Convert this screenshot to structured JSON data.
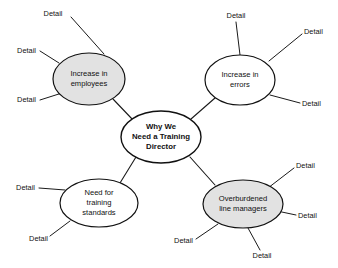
{
  "diagram": {
    "type": "mind-map",
    "background_color": "#ffffff",
    "stroke_color": "#111111",
    "shaded_fill": "#e2e2e2",
    "plain_fill": "#ffffff",
    "center": {
      "id": "center",
      "lines": [
        "Why We",
        "Need a Training",
        "Director"
      ],
      "line1": "Why We",
      "line2": "Need a Training",
      "line3": "Director",
      "fill": "#ffffff",
      "bold": true,
      "cx": 161,
      "cy": 137,
      "rx": 40,
      "ry": 26
    },
    "branches": [
      {
        "id": "increase-in-employees",
        "line1": "Increase in",
        "line2": "employees",
        "fill": "#e2e2e2",
        "cx": 89,
        "cy": 79,
        "rx": 36,
        "ry": 26,
        "details": [
          {
            "label": "Detail",
            "x": 53,
            "y": 14,
            "anchor": "middle",
            "lx1": 71,
            "ly1": 17,
            "lx2": 104,
            "ly2": 54
          },
          {
            "label": "Detail",
            "x": 36,
            "y": 51,
            "anchor": "end",
            "lx1": 40,
            "ly1": 51,
            "lx2": 59,
            "ly2": 63
          },
          {
            "label": "Detail",
            "x": 36,
            "y": 100,
            "anchor": "end",
            "lx1": 40,
            "ly1": 100,
            "lx2": 62,
            "ly2": 93
          }
        ]
      },
      {
        "id": "increase-in-errors",
        "line1": "Increase in",
        "line2": "errors",
        "fill": "#ffffff",
        "cx": 240,
        "cy": 80,
        "rx": 35,
        "ry": 25,
        "details": [
          {
            "label": "Detail",
            "x": 236,
            "y": 16,
            "anchor": "middle",
            "lx1": 236,
            "ly1": 22,
            "lx2": 240,
            "ly2": 55
          },
          {
            "label": "Detail",
            "x": 304,
            "y": 32,
            "anchor": "start",
            "lx1": 302,
            "ly1": 34,
            "lx2": 269,
            "ly2": 61
          },
          {
            "label": "Detail",
            "x": 302,
            "y": 104,
            "anchor": "start",
            "lx1": 300,
            "ly1": 103,
            "lx2": 270,
            "ly2": 95
          }
        ]
      },
      {
        "id": "need-for-training-standards",
        "line1": "Need for",
        "line2": "training",
        "line3": "standards",
        "fill": "#ffffff",
        "cx": 99,
        "cy": 203,
        "rx": 39,
        "ry": 24,
        "details": [
          {
            "label": "Detail",
            "x": 35,
            "y": 188,
            "anchor": "end",
            "lx1": 39,
            "ly1": 188,
            "lx2": 65,
            "ly2": 190
          },
          {
            "label": "Detail",
            "x": 48,
            "y": 239,
            "anchor": "end",
            "lx1": 50,
            "ly1": 236,
            "lx2": 70,
            "ly2": 221
          }
        ]
      },
      {
        "id": "overburdened-line-managers",
        "line1": "Overburdened",
        "line2": "line managers",
        "fill": "#e2e2e2",
        "cx": 243,
        "cy": 204,
        "rx": 40,
        "ry": 24,
        "details": [
          {
            "label": "Detail",
            "x": 296,
            "y": 166,
            "anchor": "start",
            "lx1": 294,
            "ly1": 168,
            "lx2": 268,
            "ly2": 188
          },
          {
            "label": "Detail",
            "x": 298,
            "y": 216,
            "anchor": "start",
            "lx1": 296,
            "ly1": 215,
            "lx2": 277,
            "ly2": 211
          },
          {
            "label": "Detail",
            "x": 193,
            "y": 241,
            "anchor": "end",
            "lx1": 196,
            "ly1": 239,
            "lx2": 218,
            "ly2": 224
          },
          {
            "label": "Detail",
            "x": 262,
            "y": 256,
            "anchor": "middle",
            "lx1": 260,
            "ly1": 250,
            "lx2": 248,
            "ly2": 228
          }
        ]
      }
    ],
    "connectors": [
      {
        "id": "center-to-employees",
        "x1": 133,
        "y1": 120,
        "x2": 113,
        "y2": 99
      },
      {
        "id": "center-to-errors",
        "x1": 191,
        "y1": 119,
        "x2": 215,
        "y2": 98
      },
      {
        "id": "center-to-standards",
        "x1": 136,
        "y1": 157,
        "x2": 120,
        "y2": 183
      },
      {
        "id": "center-to-managers",
        "x1": 190,
        "y1": 157,
        "x2": 215,
        "y2": 185
      }
    ]
  }
}
